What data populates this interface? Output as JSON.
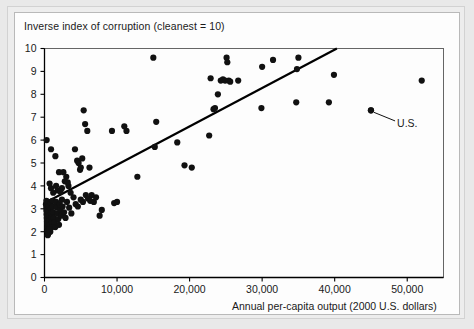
{
  "chart_data": {
    "type": "scatter",
    "title": "Inverse index of corruption (cleanest = 10)",
    "xlabel": "Annual per-capita output (2000 U.S. dollars)",
    "ylabel": "Inverse index of corruption (cleanest = 10)",
    "xlim": [
      0,
      55000
    ],
    "ylim": [
      0,
      10
    ],
    "grid": false,
    "legend": null,
    "xticks": [
      0,
      10000,
      20000,
      30000,
      40000,
      50000
    ],
    "xtick_labels": [
      "0",
      "10,000",
      "20,000",
      "30,000",
      "40,000",
      "50,000"
    ],
    "yticks": [
      0,
      1,
      2,
      3,
      4,
      5,
      6,
      7,
      8,
      9,
      10
    ],
    "ytick_labels": [
      "0",
      "1",
      "2",
      "3",
      "4",
      "5",
      "6",
      "7",
      "8",
      "9",
      "10"
    ],
    "marker_color": "#111111",
    "marker_size": 3.1,
    "annotations": [
      {
        "text": "U.S.",
        "point_x": 45000,
        "point_y": 7.3,
        "label_x": 48600,
        "label_y": 6.75
      }
    ],
    "trendline": {
      "type": "line",
      "color": "#000000",
      "width": 2.2,
      "x_start": 300,
      "y_start": 3.3,
      "x_end": 40300,
      "y_end": 10.0
    },
    "points": [
      [
        300,
        6.0
      ],
      [
        900,
        5.6
      ],
      [
        1500,
        5.3
      ],
      [
        2000,
        4.6
      ],
      [
        2600,
        4.6
      ],
      [
        3300,
        4.0
      ],
      [
        3600,
        3.7
      ],
      [
        4200,
        5.6
      ],
      [
        4500,
        5.1
      ],
      [
        4700,
        5.0
      ],
      [
        4900,
        4.7
      ],
      [
        5000,
        4.8
      ],
      [
        5200,
        5.2
      ],
      [
        5400,
        7.3
      ],
      [
        5600,
        6.7
      ],
      [
        5900,
        6.4
      ],
      [
        6200,
        4.8
      ],
      [
        6500,
        3.6
      ],
      [
        6800,
        3.3
      ],
      [
        7100,
        3.5
      ],
      [
        7600,
        2.7
      ],
      [
        7900,
        2.95
      ],
      [
        9300,
        6.4
      ],
      [
        9600,
        3.25
      ],
      [
        10000,
        3.3
      ],
      [
        11000,
        6.6
      ],
      [
        11300,
        6.4
      ],
      [
        12800,
        4.4
      ],
      [
        15000,
        9.6
      ],
      [
        15200,
        5.7
      ],
      [
        15400,
        6.8
      ],
      [
        18300,
        5.9
      ],
      [
        19300,
        4.9
      ],
      [
        20300,
        4.8
      ],
      [
        22700,
        6.2
      ],
      [
        22900,
        8.7
      ],
      [
        23300,
        7.35
      ],
      [
        23500,
        7.4
      ],
      [
        23900,
        8.0
      ],
      [
        24300,
        8.6
      ],
      [
        24600,
        8.65
      ],
      [
        24900,
        8.6
      ],
      [
        25100,
        9.6
      ],
      [
        25200,
        9.4
      ],
      [
        25400,
        8.6
      ],
      [
        25600,
        8.55
      ],
      [
        26700,
        8.6
      ],
      [
        29900,
        7.4
      ],
      [
        30000,
        9.2
      ],
      [
        31500,
        9.5
      ],
      [
        34700,
        7.65
      ],
      [
        34800,
        9.1
      ],
      [
        35000,
        9.6
      ],
      [
        39200,
        7.65
      ],
      [
        39900,
        8.85
      ],
      [
        45000,
        7.3
      ],
      [
        52000,
        8.6
      ],
      [
        200,
        3.2
      ],
      [
        250,
        3.05
      ],
      [
        280,
        2.9
      ],
      [
        300,
        2.75
      ],
      [
        320,
        2.6
      ],
      [
        350,
        2.45
      ],
      [
        370,
        2.3
      ],
      [
        400,
        2.15
      ],
      [
        420,
        2.0
      ],
      [
        450,
        1.85
      ],
      [
        260,
        3.35
      ],
      [
        290,
        3.15
      ],
      [
        310,
        2.95
      ],
      [
        340,
        2.8
      ],
      [
        360,
        2.65
      ],
      [
        390,
        2.5
      ],
      [
        410,
        2.35
      ],
      [
        440,
        2.2
      ],
      [
        470,
        2.05
      ],
      [
        490,
        1.9
      ],
      [
        520,
        3.3
      ],
      [
        560,
        3.1
      ],
      [
        600,
        2.9
      ],
      [
        640,
        2.7
      ],
      [
        680,
        2.5
      ],
      [
        720,
        2.3
      ],
      [
        760,
        2.15
      ],
      [
        800,
        2.0
      ],
      [
        840,
        3.25
      ],
      [
        880,
        3.0
      ],
      [
        920,
        2.8
      ],
      [
        960,
        2.6
      ],
      [
        1000,
        2.4
      ],
      [
        1050,
        2.2
      ],
      [
        1100,
        3.35
      ],
      [
        1150,
        3.1
      ],
      [
        1200,
        2.85
      ],
      [
        1300,
        2.6
      ],
      [
        1400,
        2.4
      ],
      [
        1500,
        2.2
      ],
      [
        1600,
        3.3
      ],
      [
        1700,
        3.05
      ],
      [
        1800,
        2.8
      ],
      [
        1900,
        2.55
      ],
      [
        2000,
        2.3
      ],
      [
        2100,
        3.2
      ],
      [
        2200,
        2.95
      ],
      [
        2300,
        2.7
      ],
      [
        2400,
        3.4
      ],
      [
        2500,
        3.1
      ],
      [
        2700,
        2.85
      ],
      [
        2900,
        2.6
      ],
      [
        3100,
        3.3
      ],
      [
        3400,
        3.05
      ],
      [
        3700,
        2.8
      ],
      [
        4000,
        3.5
      ],
      [
        4300,
        3.2
      ],
      [
        4600,
        3.1
      ],
      [
        5000,
        3.4
      ],
      [
        5300,
        3.3
      ],
      [
        5700,
        3.6
      ],
      [
        6000,
        3.45
      ],
      [
        6300,
        3.35
      ],
      [
        2800,
        4.2
      ],
      [
        3000,
        4.4
      ],
      [
        3200,
        4.15
      ],
      [
        2400,
        3.9
      ],
      [
        1800,
        3.8
      ],
      [
        1600,
        4.0
      ],
      [
        2200,
        3.75
      ],
      [
        900,
        3.9
      ],
      [
        700,
        4.1
      ],
      [
        1200,
        3.7
      ],
      [
        580,
        1.95
      ],
      [
        620,
        2.1
      ]
    ]
  },
  "axis": {
    "xlabel_text": "Annual per-capita output (2000 U.S. dollars)",
    "title_text": "Inverse index of corruption (cleanest = 10)"
  }
}
